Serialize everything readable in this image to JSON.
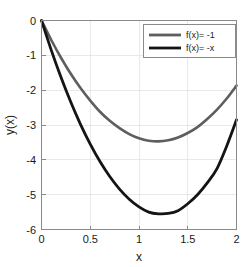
{
  "chart_data": {
    "type": "line",
    "title": "",
    "xlabel": "x",
    "ylabel": "y(x)",
    "xlim": [
      0,
      2
    ],
    "ylim": [
      -6,
      0
    ],
    "xticks": [
      "0",
      "0.5",
      "1",
      "1.5",
      "2"
    ],
    "xtick_values": [
      0,
      0.5,
      1,
      1.5,
      2
    ],
    "yticks": [
      "0",
      "-1",
      "-2",
      "-3",
      "-4",
      "-5",
      "-6"
    ],
    "ytick_values": [
      0,
      -1,
      -2,
      -3,
      -4,
      -5,
      -6
    ],
    "grid": true,
    "legend_position": "top-right",
    "series": [
      {
        "name": "f(x)= -1",
        "color": "#5e5e5e",
        "linewidth": 2.6,
        "x": [
          0,
          0.1,
          0.2,
          0.3,
          0.4,
          0.5,
          0.6,
          0.7,
          0.8,
          0.9,
          1.0,
          1.1,
          1.2,
          1.3,
          1.4,
          1.5,
          1.6,
          1.7,
          1.8,
          1.9,
          2.0
        ],
        "y": [
          0,
          -0.56,
          -1.07,
          -1.53,
          -1.94,
          -2.3,
          -2.62,
          -2.88,
          -3.09,
          -3.26,
          -3.38,
          -3.45,
          -3.47,
          -3.44,
          -3.36,
          -3.23,
          -3.06,
          -2.83,
          -2.56,
          -2.24,
          -1.87
        ]
      },
      {
        "name": "f(x)= -x",
        "color": "#141414",
        "linewidth": 2.8,
        "x": [
          0,
          0.1,
          0.2,
          0.3,
          0.4,
          0.5,
          0.6,
          0.7,
          0.8,
          0.9,
          1.0,
          1.1,
          1.2,
          1.3,
          1.4,
          1.5,
          1.6,
          1.7,
          1.8,
          1.9,
          2.0
        ],
        "y": [
          0,
          -0.85,
          -1.63,
          -2.34,
          -2.98,
          -3.55,
          -4.05,
          -4.48,
          -4.84,
          -5.13,
          -5.35,
          -5.5,
          -5.55,
          -5.54,
          -5.46,
          -5.26,
          -5.0,
          -4.66,
          -4.25,
          -3.6,
          -2.85
        ]
      }
    ],
    "legend_entries": [
      {
        "label": "f(x)= -1",
        "color": "#5e5e5e"
      },
      {
        "label": "f(x)= -x",
        "color": "#141414"
      }
    ]
  }
}
